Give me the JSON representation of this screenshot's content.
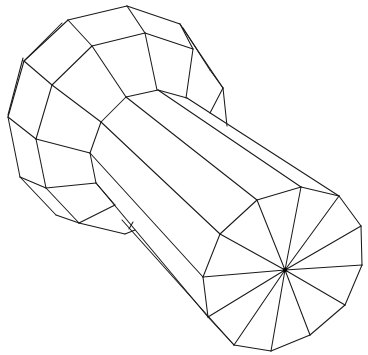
{
  "figure": {
    "title": "",
    "stroke_color": "#1a1a1a",
    "background": "#ffffff",
    "hub": {
      "x": 285,
      "y": 270,
      "r": 2.2
    },
    "end_cap": [
      [
        257,
        200
      ],
      [
        301,
        187
      ],
      [
        339,
        196
      ],
      [
        361,
        226
      ],
      [
        362,
        265
      ],
      [
        345,
        305
      ],
      [
        310,
        335
      ],
      [
        271,
        351
      ],
      [
        234,
        345
      ],
      [
        208,
        317
      ],
      [
        203,
        277
      ],
      [
        220,
        234
      ]
    ],
    "shaft_edges": [
      [
        [
          187,
          98
        ],
        [
          339,
          196
        ]
      ],
      [
        [
          158,
          90
        ],
        [
          301,
          187
        ]
      ],
      [
        [
          126,
          97
        ],
        [
          257,
          200
        ]
      ],
      [
        [
          101,
          122
        ],
        [
          220,
          234
        ]
      ],
      [
        [
          90,
          153
        ],
        [
          203,
          277
        ]
      ],
      [
        [
          96,
          183
        ],
        [
          208,
          317
        ]
      ],
      [
        [
          122,
          220
        ],
        [
          234,
          345
        ]
      ]
    ],
    "head_edges": [
      [
        [
          68,
          20
        ],
        [
          127,
          6
        ]
      ],
      [
        [
          127,
          6
        ],
        [
          180,
          24
        ]
      ],
      [
        [
          62,
          23
        ],
        [
          24,
          61
        ]
      ],
      [
        [
          68,
          20
        ],
        [
          24,
          61
        ]
      ],
      [
        [
          24,
          61
        ],
        [
          8,
          117
        ]
      ],
      [
        [
          23,
          58
        ],
        [
          8,
          115
        ]
      ],
      [
        [
          180,
          24
        ],
        [
          223,
          88
        ]
      ],
      [
        [
          183,
          28
        ],
        [
          210,
          70
        ]
      ],
      [
        [
          210,
          70
        ],
        [
          223,
          88
        ]
      ],
      [
        [
          223,
          88
        ],
        [
          227,
          126
        ]
      ],
      [
        [
          223,
          88
        ],
        [
          210,
          113
        ]
      ],
      [
        [
          68,
          20
        ],
        [
          92,
          46
        ]
      ],
      [
        [
          127,
          6
        ],
        [
          145,
          33
        ]
      ],
      [
        [
          92,
          46
        ],
        [
          145,
          33
        ]
      ],
      [
        [
          145,
          33
        ],
        [
          193,
          49
        ]
      ],
      [
        [
          180,
          24
        ],
        [
          193,
          49
        ]
      ],
      [
        [
          145,
          33
        ],
        [
          157,
          90
        ]
      ],
      [
        [
          193,
          49
        ],
        [
          186,
          98
        ]
      ],
      [
        [
          92,
          46
        ],
        [
          52,
          85
        ]
      ],
      [
        [
          92,
          46
        ],
        [
          126,
          97
        ]
      ],
      [
        [
          24,
          61
        ],
        [
          52,
          85
        ]
      ],
      [
        [
          52,
          85
        ],
        [
          101,
          122
        ]
      ],
      [
        [
          126,
          97
        ],
        [
          158,
          90
        ]
      ],
      [
        [
          158,
          90
        ],
        [
          187,
          98
        ]
      ],
      [
        [
          126,
          97
        ],
        [
          101,
          122
        ]
      ],
      [
        [
          52,
          85
        ],
        [
          36,
          139
        ]
      ],
      [
        [
          8,
          117
        ],
        [
          36,
          139
        ]
      ],
      [
        [
          36,
          139
        ],
        [
          90,
          153
        ]
      ],
      [
        [
          101,
          122
        ],
        [
          90,
          153
        ]
      ],
      [
        [
          8,
          117
        ],
        [
          20,
          177
        ]
      ],
      [
        [
          36,
          139
        ],
        [
          46,
          188
        ]
      ],
      [
        [
          20,
          177
        ],
        [
          46,
          188
        ]
      ],
      [
        [
          46,
          188
        ],
        [
          96,
          183
        ]
      ],
      [
        [
          90,
          153
        ],
        [
          96,
          183
        ]
      ],
      [
        [
          20,
          177
        ],
        [
          56,
          215
        ]
      ],
      [
        [
          56,
          215
        ],
        [
          79,
          223
        ]
      ],
      [
        [
          46,
          188
        ],
        [
          79,
          223
        ]
      ],
      [
        [
          96,
          183
        ],
        [
          115,
          205
        ]
      ],
      [
        [
          79,
          223
        ],
        [
          115,
          205
        ]
      ],
      [
        [
          79,
          223
        ],
        [
          125,
          234
        ]
      ],
      [
        [
          125,
          234
        ],
        [
          135,
          230
        ]
      ],
      [
        [
          129,
          229
        ],
        [
          133,
          222
        ]
      ]
    ]
  }
}
